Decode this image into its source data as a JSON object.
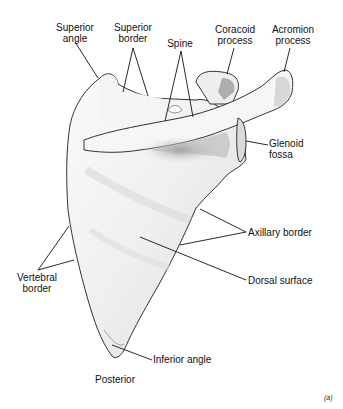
{
  "figure": {
    "view": "Posterior",
    "panel": "(a)"
  },
  "labels": {
    "superior_angle": "Superior angle",
    "superior_border": "Superior border",
    "spine": "Spine",
    "coracoid_process": "Coracoid process",
    "acromion_process": "Acromion process",
    "glenoid_fossa": "Glenoid fossa",
    "axillary_border": "Axillary border",
    "dorsal_surface": "Dorsal surface",
    "vertebral_border": "Vertebral border",
    "inferior_angle": "Inferior angle"
  },
  "label_lines": {
    "superior_angle": [
      "Superior",
      "angle"
    ],
    "superior_border": [
      "Superior",
      "border"
    ],
    "spine": [
      "Spine"
    ],
    "coracoid_process": [
      "Coracoid",
      "process"
    ],
    "acromion_process": [
      "Acromion",
      "process"
    ],
    "glenoid_fossa": [
      "Glenoid",
      "fossa"
    ],
    "vertebral_border": [
      "Vertebral",
      "border"
    ]
  },
  "colors": {
    "bone_fill": "#f1f1f1",
    "bone_shade": "#c8c8c8",
    "outline": "#333333",
    "leader_line": "#111111"
  }
}
